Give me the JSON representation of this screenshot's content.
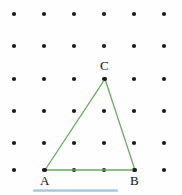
{
  "figure": {
    "background_color": "#fefefe",
    "width": 182,
    "height": 195
  },
  "grid": {
    "dot_color": "#1c1c1c",
    "dot_radius": 2.1,
    "columns": 6,
    "rows": 6,
    "x_positions": [
      14,
      44,
      74,
      104,
      134,
      164
    ],
    "y_positions": [
      14,
      46,
      79,
      111,
      143,
      170
    ],
    "dot_name": "grid-dot"
  },
  "triangle": {
    "stroke_color": "#67a95e",
    "stroke_width": 1.3,
    "fill": "none",
    "vertices": [
      {
        "id": "A",
        "label": "A",
        "x": 45,
        "y": 170,
        "label_x": 40,
        "label_y": 174
      },
      {
        "id": "B",
        "label": "B",
        "x": 135,
        "y": 170,
        "label_x": 130,
        "label_y": 174
      },
      {
        "id": "C",
        "label": "C",
        "x": 105,
        "y": 79,
        "label_x": 100,
        "label_y": 59
      }
    ],
    "vertex_dot_color": "#1c1c1c",
    "points_path": "45,170 135,170 105,79"
  },
  "selection_bar": {
    "color": "#a8c4db",
    "x": 33,
    "y": 189,
    "width": 85,
    "height": 3
  }
}
